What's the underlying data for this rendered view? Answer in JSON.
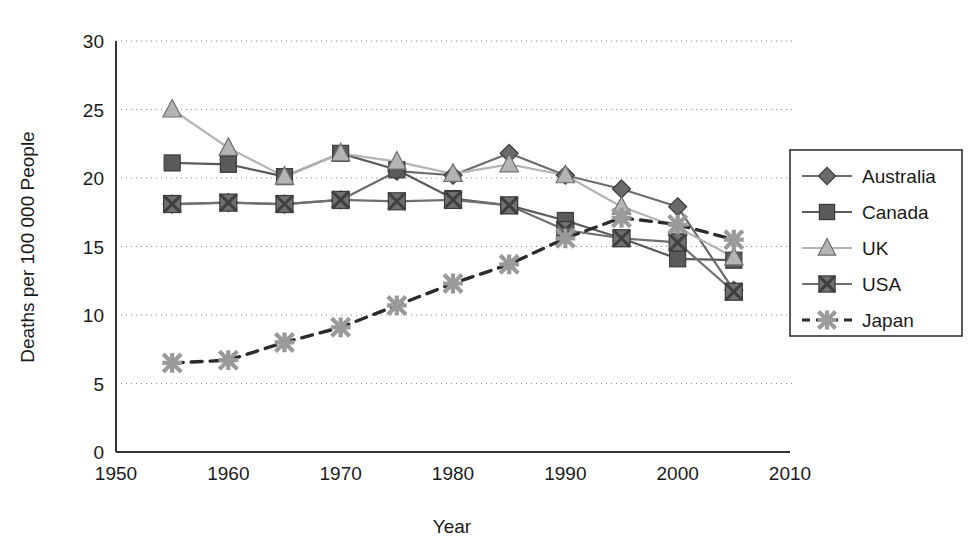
{
  "chart_data": {
    "type": "line",
    "title": "",
    "xlabel": "Year",
    "ylabel": "Deaths per 100 000 People",
    "xlim": [
      1950,
      2010
    ],
    "ylim": [
      0,
      30
    ],
    "xticks": [
      1950,
      1960,
      1970,
      1980,
      1990,
      2000,
      2010
    ],
    "yticks": [
      0,
      5,
      10,
      15,
      20,
      25,
      30
    ],
    "grid": "horizontal-dotted",
    "legend_position": "right-outside",
    "x": [
      1955,
      1960,
      1965,
      1970,
      1975,
      1980,
      1985,
      1990,
      1995,
      2000,
      2005
    ],
    "series": [
      {
        "name": "Australia",
        "marker": "diamond",
        "linestyle": "solid",
        "color": "#6b6b6b",
        "values": [
          18.1,
          18.2,
          18.1,
          18.4,
          20.5,
          20.2,
          21.8,
          20.2,
          19.2,
          17.9,
          11.8
        ]
      },
      {
        "name": "Canada",
        "marker": "square",
        "linestyle": "solid",
        "color": "#5a5a5a",
        "values": [
          21.1,
          21.0,
          20.1,
          21.8,
          20.6,
          18.5,
          18.0,
          16.9,
          15.6,
          14.1,
          14.0
        ]
      },
      {
        "name": "UK",
        "marker": "triangle",
        "linestyle": "solid",
        "color": "#b4b4b4",
        "values": [
          25.0,
          22.2,
          20.1,
          21.8,
          21.2,
          20.3,
          21.0,
          20.2,
          17.9,
          16.4,
          14.2
        ]
      },
      {
        "name": "USA",
        "marker": "square-x",
        "linestyle": "solid",
        "color": "#707070",
        "values": [
          18.1,
          18.2,
          18.1,
          18.4,
          18.3,
          18.4,
          18.0,
          16.2,
          15.6,
          15.3,
          11.7
        ]
      },
      {
        "name": "Japan",
        "marker": "asterisk",
        "linestyle": "dashed",
        "color": "#9a9a9a",
        "values": [
          6.5,
          6.7,
          8.0,
          9.1,
          10.7,
          12.3,
          13.7,
          15.6,
          17.1,
          16.6,
          15.5
        ]
      }
    ]
  },
  "axes": {
    "x_title": "Year",
    "y_title": "Deaths per 100 000 People",
    "x_tick_labels": [
      "1950",
      "1960",
      "1970",
      "1980",
      "1990",
      "2000",
      "2010"
    ],
    "y_tick_labels": [
      "0",
      "5",
      "10",
      "15",
      "20",
      "25",
      "30"
    ]
  },
  "legend": {
    "items": [
      {
        "label": "Australia",
        "marker": "diamond-icon",
        "linestyle": "solid"
      },
      {
        "label": "Canada",
        "marker": "square-icon",
        "linestyle": "solid"
      },
      {
        "label": "UK",
        "marker": "triangle-icon",
        "linestyle": "solid"
      },
      {
        "label": "USA",
        "marker": "square-x-icon",
        "linestyle": "solid"
      },
      {
        "label": "Japan",
        "marker": "asterisk-icon",
        "linestyle": "dashed"
      }
    ]
  },
  "colors": {
    "axis": "#333333",
    "grid": "#8a8a8a",
    "background": "#ffffff",
    "australia": "#6b6b6b",
    "canada": "#5a5a5a",
    "uk": "#b4b4b4",
    "usa": "#707070",
    "japan": "#9a9a9a"
  }
}
